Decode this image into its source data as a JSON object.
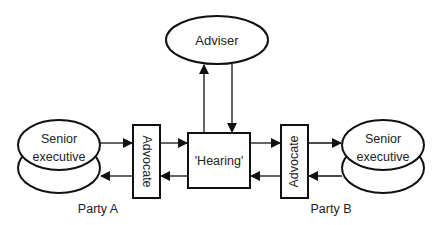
{
  "diagram": {
    "type": "flow",
    "nodes": {
      "adviser": {
        "label": "Adviser",
        "shape": "ellipse"
      },
      "hearing": {
        "label": "'Hearing'",
        "shape": "rectangle"
      },
      "advocate_a": {
        "label": "Advocate",
        "shape": "rectangle",
        "orientation": "vertical"
      },
      "advocate_b": {
        "label": "Advocate",
        "shape": "rectangle",
        "orientation": "vertical"
      },
      "executive_a": {
        "label_line1": "Senior",
        "label_line2": "executive",
        "shape": "stacked-ellipse"
      },
      "executive_b": {
        "label_line1": "Senior",
        "label_line2": "executive",
        "shape": "stacked-ellipse"
      }
    },
    "party_labels": {
      "a": "Party A",
      "b": "Party B"
    },
    "edges": [
      {
        "from": "executive_a",
        "to": "advocate_a"
      },
      {
        "from": "advocate_a",
        "to": "executive_a"
      },
      {
        "from": "advocate_a",
        "to": "hearing"
      },
      {
        "from": "hearing",
        "to": "advocate_a"
      },
      {
        "from": "hearing",
        "to": "advocate_b"
      },
      {
        "from": "advocate_b",
        "to": "hearing"
      },
      {
        "from": "advocate_b",
        "to": "executive_b"
      },
      {
        "from": "executive_b",
        "to": "advocate_b"
      },
      {
        "from": "hearing",
        "to": "adviser"
      },
      {
        "from": "adviser",
        "to": "hearing"
      }
    ],
    "colors": {
      "stroke": "#111111",
      "text": "#222222",
      "background": "#ffffff"
    }
  }
}
